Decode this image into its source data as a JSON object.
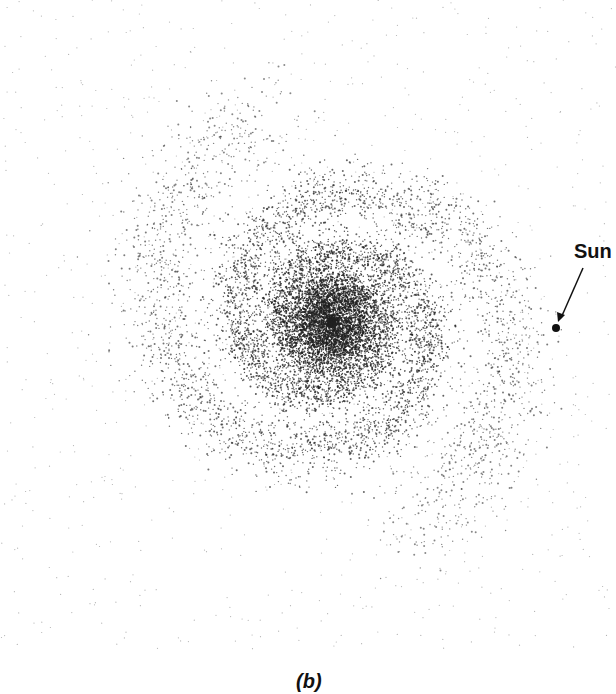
{
  "figure": {
    "caption": "(b)",
    "annotations": [
      {
        "label": "Sun",
        "x": 556,
        "y": 328
      }
    ]
  },
  "labels": {
    "sun": "Sun"
  },
  "colors": {
    "background": "#ffffff",
    "dots": "#222222"
  },
  "galaxy": {
    "center": [
      332,
      322
    ],
    "arms": 2
  }
}
